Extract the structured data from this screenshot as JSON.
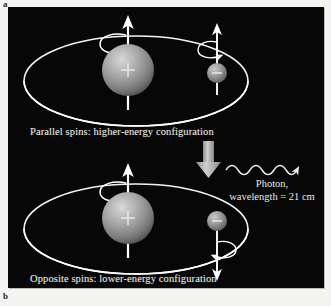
{
  "figure": {
    "part_label_a": "a",
    "part_label_b": "b",
    "background_color": "#070707",
    "page_color": "#f4f4f2",
    "orbit_color": "#ffffff",
    "proton_color": "#9a9a9a",
    "electron_color": "#8c8c8c",
    "transition_arrow_color": "#b8b8b8",
    "text_color": "#eceae4"
  },
  "panels": {
    "top": {
      "caption": "Parallel spins:  higher-energy configuration",
      "proton_charge": "+",
      "electron_charge": "–",
      "proton_spin_direction": "up",
      "electron_spin_direction": "up"
    },
    "bottom": {
      "caption": "Opposite spins:  lower-energy configuration",
      "proton_charge": "+",
      "electron_charge": "–",
      "proton_spin_direction": "up",
      "electron_spin_direction": "down"
    }
  },
  "photon": {
    "line1": "Photon,",
    "line2": "wavelength = 21 cm"
  }
}
